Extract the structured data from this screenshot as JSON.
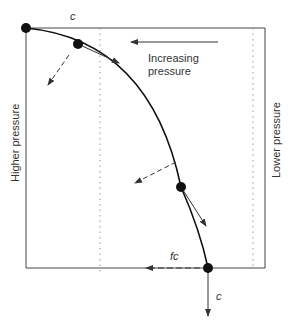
{
  "diagram": {
    "labels": {
      "top_c": "c",
      "increasing_line1": "Increasing",
      "increasing_line2": "pressure",
      "higher_pressure": "Higher pressure",
      "lower_pressure": "Lower pressure",
      "fc": "fc",
      "bottom_c": "c"
    },
    "colors": {
      "line": "#333333",
      "dot": "#111111",
      "dotted": "#999999",
      "background": "#ffffff"
    },
    "points": [
      {
        "name": "start",
        "x": 26,
        "y": 28
      },
      {
        "name": "p1",
        "x": 78,
        "y": 44
      },
      {
        "name": "p2",
        "x": 181,
        "y": 187
      },
      {
        "name": "end",
        "x": 208,
        "y": 268
      }
    ]
  }
}
